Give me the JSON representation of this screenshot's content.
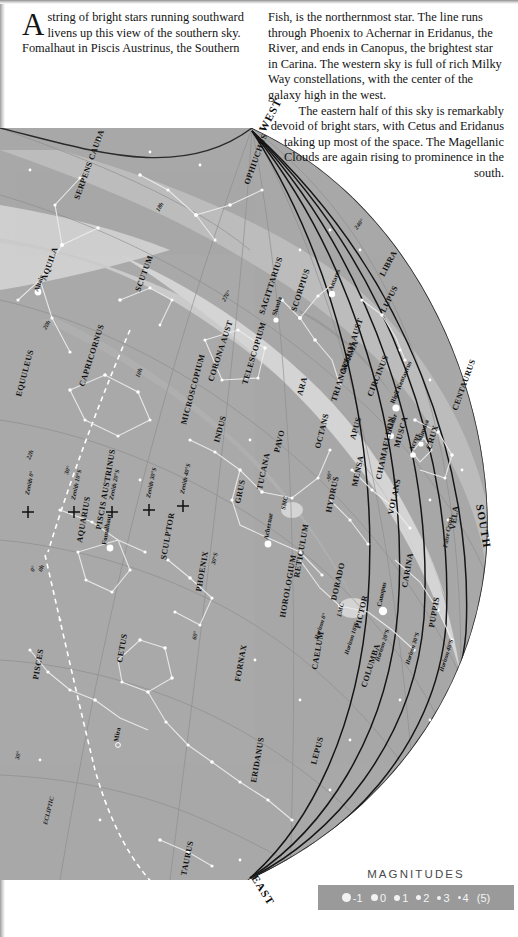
{
  "article": {
    "dropcap": "A",
    "left_paragraph": "string of bright stars running southward livens up this view of the southern sky. Fomalhaut in Piscis Austrinus, the Southern",
    "right_paragraph_1": "Fish, is the northernmost star. The line runs through Phoenix to Achernar in Eridanus, the River, and ends in Canopus, the brightest star in Carina. The western sky is full of rich Milky Way constellations, with the center of the galaxy high in the west.",
    "right_paragraph_2": "The eastern half of this sky is remarkably devoid of bright stars, with Cetus and Eridanus taking up most of the space. The Magellanic Clouds are again rising to prominence in the south."
  },
  "legend": {
    "title": "MAGNITUDES",
    "items": [
      {
        "label": "-1",
        "size": 9
      },
      {
        "label": "0",
        "size": 7.5
      },
      {
        "label": "1",
        "size": 6
      },
      {
        "label": "2",
        "size": 5
      },
      {
        "label": "3",
        "size": 4
      },
      {
        "label": "4",
        "size": 3
      },
      {
        "label": "(5)",
        "size": 0
      }
    ]
  },
  "chart_data": {
    "type": "scatter",
    "colors": {
      "sky": "#a9a9a9",
      "milky_way_light": "#c6c6c6",
      "milky_way_mid": "#bcbcbc",
      "milky_way_dark": "#9a9a9a",
      "star": "#ffffff",
      "constellation_line": "#e8e8e8",
      "grid": "#8c8c8c",
      "horizon_line": "#1a1a1a",
      "ecliptic": "#ffffff",
      "text": "#111111",
      "legend_bar": "#9a9a9a"
    },
    "cardinal_points": [
      {
        "label": "WEST",
        "x": 265,
        "y": 133,
        "rot": -62
      },
      {
        "label": "SOUTH",
        "x": 476,
        "y": 505,
        "rot": 80
      },
      {
        "label": "EAST",
        "x": 251,
        "y": 878,
        "rot": 58
      }
    ],
    "constellations": [
      {
        "name": "SERPENS CAUDA",
        "x": 79,
        "y": 200,
        "rot": -70
      },
      {
        "name": "OPHIUCHUS",
        "x": 249,
        "y": 185,
        "rot": -70
      },
      {
        "name": "AQUILA",
        "x": 46,
        "y": 281,
        "rot": -70
      },
      {
        "name": "SCUTUM",
        "x": 140,
        "y": 292,
        "rot": -70
      },
      {
        "name": "SAGITTARIUS",
        "x": 264,
        "y": 315,
        "rot": -72
      },
      {
        "name": "SCORPIUS",
        "x": 296,
        "y": 312,
        "rot": -72
      },
      {
        "name": "EQUULEUS",
        "x": 21,
        "y": 397,
        "rot": -75
      },
      {
        "name": "CAPRICORNUS",
        "x": 84,
        "y": 387,
        "rot": -72
      },
      {
        "name": "CORONA AUST",
        "x": 213,
        "y": 382,
        "rot": -72
      },
      {
        "name": "TELESCOPIUM",
        "x": 247,
        "y": 385,
        "rot": -73
      },
      {
        "name": "ARA",
        "x": 302,
        "y": 396,
        "rot": -74
      },
      {
        "name": "NORMA",
        "x": 345,
        "y": 373,
        "rot": -67
      },
      {
        "name": "TRIANGULUM AUST",
        "x": 336,
        "y": 402,
        "rot": -72
      },
      {
        "name": "CIRCINUS",
        "x": 372,
        "y": 397,
        "rot": -68
      },
      {
        "name": "LIBRA",
        "x": 384,
        "y": 277,
        "rot": -62
      },
      {
        "name": "LUPUS",
        "x": 385,
        "y": 313,
        "rot": -63
      },
      {
        "name": "CENTAURUS",
        "x": 457,
        "y": 411,
        "rot": -70
      },
      {
        "name": "MICROSCOPIUM",
        "x": 186,
        "y": 425,
        "rot": -75
      },
      {
        "name": "INDUS",
        "x": 219,
        "y": 443,
        "rot": -75
      },
      {
        "name": "PAVO",
        "x": 279,
        "y": 453,
        "rot": -76
      },
      {
        "name": "OCTANS",
        "x": 320,
        "y": 449,
        "rot": -76
      },
      {
        "name": "APUS",
        "x": 355,
        "y": 440,
        "rot": -74
      },
      {
        "name": "MUSCA",
        "x": 399,
        "y": 448,
        "rot": -74
      },
      {
        "name": "CRUX",
        "x": 431,
        "y": 450,
        "rot": -73
      },
      {
        "name": "GRUS",
        "x": 240,
        "y": 504,
        "rot": -78
      },
      {
        "name": "TUCANA",
        "x": 262,
        "y": 490,
        "rot": -78
      },
      {
        "name": "HYDRUS",
        "x": 331,
        "y": 513,
        "rot": -78
      },
      {
        "name": "MENSA",
        "x": 357,
        "y": 487,
        "rot": -78
      },
      {
        "name": "CHAMAELEON",
        "x": 381,
        "y": 480,
        "rot": -78
      },
      {
        "name": "VOLANS",
        "x": 393,
        "y": 515,
        "rot": -78
      },
      {
        "name": "VELA",
        "x": 455,
        "y": 530,
        "rot": -82
      },
      {
        "name": "SCULPTOR",
        "x": 166,
        "y": 560,
        "rot": -80
      },
      {
        "name": "PISCIS AUSTRINUS",
        "x": 101,
        "y": 530,
        "rot": -80
      },
      {
        "name": "AQUARIUS",
        "x": 82,
        "y": 543,
        "rot": -80
      },
      {
        "name": "PHOENIX",
        "x": 201,
        "y": 592,
        "rot": -80
      },
      {
        "name": "RETICULUM",
        "x": 299,
        "y": 578,
        "rot": -80
      },
      {
        "name": "HOROLOGIUM",
        "x": 285,
        "y": 618,
        "rot": -80
      },
      {
        "name": "DORADO",
        "x": 336,
        "y": 601,
        "rot": -77
      },
      {
        "name": "PICTOR",
        "x": 360,
        "y": 629,
        "rot": -77
      },
      {
        "name": "CARINA",
        "x": 407,
        "y": 588,
        "rot": -80
      },
      {
        "name": "PUPPIS",
        "x": 434,
        "y": 628,
        "rot": -80
      },
      {
        "name": "CAELUM",
        "x": 317,
        "y": 670,
        "rot": -80
      },
      {
        "name": "COLUMBA",
        "x": 366,
        "y": 688,
        "rot": -72
      },
      {
        "name": "LEPUS",
        "x": 316,
        "y": 765,
        "rot": -75
      },
      {
        "name": "FORNAX",
        "x": 240,
        "y": 682,
        "rot": -80
      },
      {
        "name": "CETUS",
        "x": 122,
        "y": 663,
        "rot": -80
      },
      {
        "name": "PISCES",
        "x": 38,
        "y": 680,
        "rot": -80
      },
      {
        "name": "ERIDANUS",
        "x": 256,
        "y": 783,
        "rot": -80
      },
      {
        "name": "TAURUS",
        "x": 186,
        "y": 876,
        "rot": -78
      }
    ],
    "stars_named": [
      {
        "name": "Altair",
        "x": 38,
        "y": 292,
        "rot": -70,
        "mag": 0.8
      },
      {
        "name": "Antares",
        "x": 332,
        "y": 291,
        "rot": -68,
        "mag": 1.0
      },
      {
        "name": "Shaula",
        "x": 276,
        "y": 316,
        "rot": -72,
        "mag": 1.6
      },
      {
        "name": "Rigil Kentaurus",
        "x": 394,
        "y": 404,
        "rot": -67,
        "mag": -0.3
      },
      {
        "name": "Hadar",
        "x": 391,
        "y": 432,
        "rot": -70,
        "mag": 0.6
      },
      {
        "name": "Mimosa",
        "x": 421,
        "y": 442,
        "rot": -70,
        "mag": 1.3
      },
      {
        "name": "Acrux",
        "x": 413,
        "y": 451,
        "rot": -70,
        "mag": 0.8
      },
      {
        "name": "Fomalhaut",
        "x": 106,
        "y": 545,
        "rot": -80,
        "mag": 1.2
      },
      {
        "name": "Achernar",
        "x": 268,
        "y": 540,
        "rot": -80,
        "mag": 0.5
      },
      {
        "name": "Canopus",
        "x": 381,
        "y": 607,
        "rot": -78,
        "mag": -0.7
      },
      {
        "name": "Mira",
        "x": 118,
        "y": 742,
        "rot": -80,
        "mag": 3.0
      }
    ],
    "deep_sky": [
      {
        "name": "SMC",
        "x": 285,
        "y": 510,
        "rot": -78
      },
      {
        "name": "LMC",
        "x": 341,
        "y": 617,
        "rot": -78
      },
      {
        "name": "False Cross",
        "x": 447,
        "y": 548,
        "rot": -80
      }
    ],
    "grid_labels": [
      {
        "label": "18h",
        "x": 159,
        "y": 212,
        "rot": -60
      },
      {
        "label": "270°",
        "x": 225,
        "y": 302,
        "rot": -60
      },
      {
        "label": "240°",
        "x": 357,
        "y": 230,
        "rot": -52
      },
      {
        "label": "20h",
        "x": 46,
        "y": 330,
        "rot": -60
      },
      {
        "label": "22h",
        "x": 30,
        "y": 460,
        "rot": -68
      },
      {
        "label": "0h",
        "x": 42,
        "y": 572,
        "rot": -72
      },
      {
        "label": "0°",
        "x": 34,
        "y": 572,
        "rot": -72
      },
      {
        "label": "30°",
        "x": 19,
        "y": 760,
        "rot": -78
      },
      {
        "label": "-90°",
        "x": 330,
        "y": 482,
        "rot": -78
      },
      {
        "label": "10h",
        "x": 139,
        "y": 378,
        "rot": -68
      },
      {
        "label": "30°",
        "x": 68,
        "y": 475,
        "rot": -72
      },
      {
        "label": "30°S",
        "x": 215,
        "y": 565,
        "rot": -76
      },
      {
        "label": "60°",
        "x": 196,
        "y": 640,
        "rot": -78
      },
      {
        "label": "ECLIPTIC",
        "x": 47,
        "y": 825,
        "rot": -76
      }
    ],
    "zenith_marks": [
      {
        "label": "Zenith 0°",
        "x": 29,
        "y": 495,
        "rot": -78
      },
      {
        "label": "Zenith 10°S",
        "x": 75,
        "y": 500,
        "rot": -78
      },
      {
        "label": "Zenith 20°S",
        "x": 113,
        "y": 500,
        "rot": -78
      },
      {
        "label": "Zenith 30°S",
        "x": 150,
        "y": 498,
        "rot": -78
      },
      {
        "label": "Zenith 40°S",
        "x": 184,
        "y": 494,
        "rot": -78
      }
    ],
    "horizon_labels": [
      {
        "label": "Horizon 0°",
        "x": 318,
        "y": 640,
        "rot": -72
      },
      {
        "label": "Horizon 10°S",
        "x": 348,
        "y": 655,
        "rot": -72
      },
      {
        "label": "Horizon 20°S",
        "x": 379,
        "y": 662,
        "rot": -72
      },
      {
        "label": "Horizon 30°S",
        "x": 409,
        "y": 665,
        "rot": -72
      },
      {
        "label": "Horizon 40°S",
        "x": 443,
        "y": 672,
        "rot": -72
      }
    ]
  }
}
